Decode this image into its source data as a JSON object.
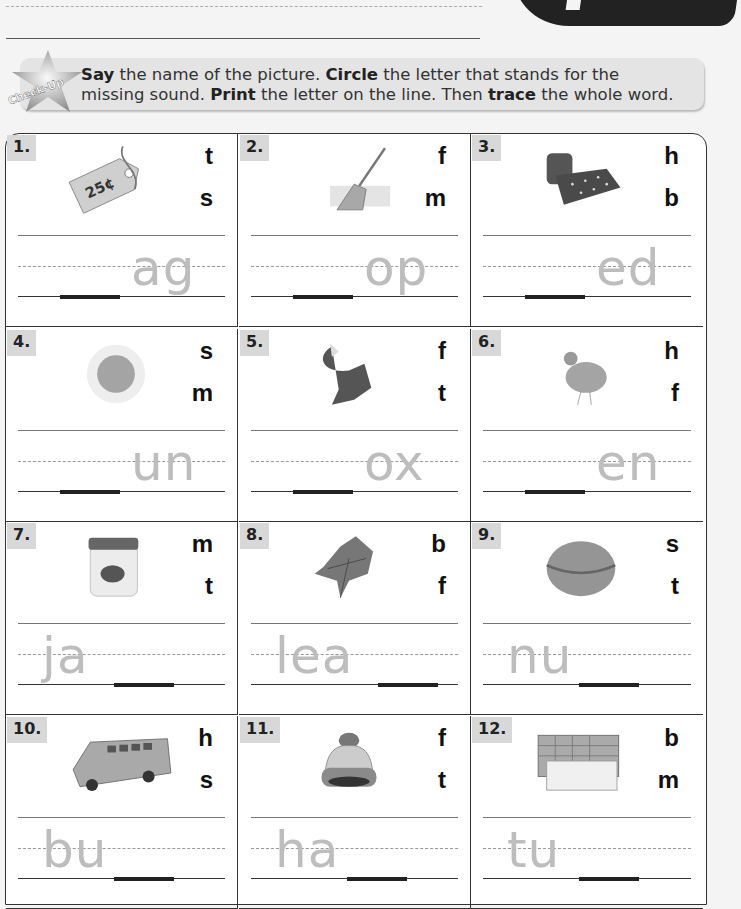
{
  "header": {
    "badge": "Check-Up",
    "instruction_parts": [
      {
        "text": "Say",
        "bold": true
      },
      {
        "text": " the name of the picture. ",
        "bold": false
      },
      {
        "text": "Circle",
        "bold": true
      },
      {
        "text": " the letter that stands for the missing sound. ",
        "bold": false
      },
      {
        "text": "Print",
        "bold": true
      },
      {
        "text": " the letter on the line. Then ",
        "bold": false
      },
      {
        "text": "trace",
        "bold": true
      },
      {
        "text": " the whole word.",
        "bold": false
      }
    ]
  },
  "items": [
    {
      "number": "1.",
      "picture": "price-tag",
      "picture_label": "25¢",
      "choices": [
        "t",
        "s"
      ],
      "trace": "ag",
      "blank_position": "start"
    },
    {
      "number": "2.",
      "picture": "mop",
      "choices": [
        "f",
        "m"
      ],
      "trace": "op",
      "blank_position": "start"
    },
    {
      "number": "3.",
      "picture": "bed",
      "choices": [
        "h",
        "b"
      ],
      "trace": "ed",
      "blank_position": "start"
    },
    {
      "number": "4.",
      "picture": "sun",
      "choices": [
        "s",
        "m"
      ],
      "trace": "un",
      "blank_position": "start"
    },
    {
      "number": "5.",
      "picture": "fox",
      "choices": [
        "f",
        "t"
      ],
      "trace": "ox",
      "blank_position": "start"
    },
    {
      "number": "6.",
      "picture": "hen",
      "choices": [
        "h",
        "f"
      ],
      "trace": "en",
      "blank_position": "start"
    },
    {
      "number": "7.",
      "picture": "jam-jar",
      "choices": [
        "m",
        "t"
      ],
      "trace": "ja",
      "blank_position": "end"
    },
    {
      "number": "8.",
      "picture": "leaf",
      "choices": [
        "b",
        "f"
      ],
      "trace": "lea",
      "blank_position": "end"
    },
    {
      "number": "9.",
      "picture": "nut",
      "choices": [
        "s",
        "t"
      ],
      "trace": "nu",
      "blank_position": "end"
    },
    {
      "number": "10.",
      "picture": "bus",
      "choices": [
        "h",
        "s"
      ],
      "trace": "bu",
      "blank_position": "end"
    },
    {
      "number": "11.",
      "picture": "hat",
      "choices": [
        "f",
        "t"
      ],
      "trace": "ha",
      "blank_position": "end"
    },
    {
      "number": "12.",
      "picture": "tub",
      "choices": [
        "b",
        "m"
      ],
      "trace": "tu",
      "blank_position": "end"
    }
  ]
}
